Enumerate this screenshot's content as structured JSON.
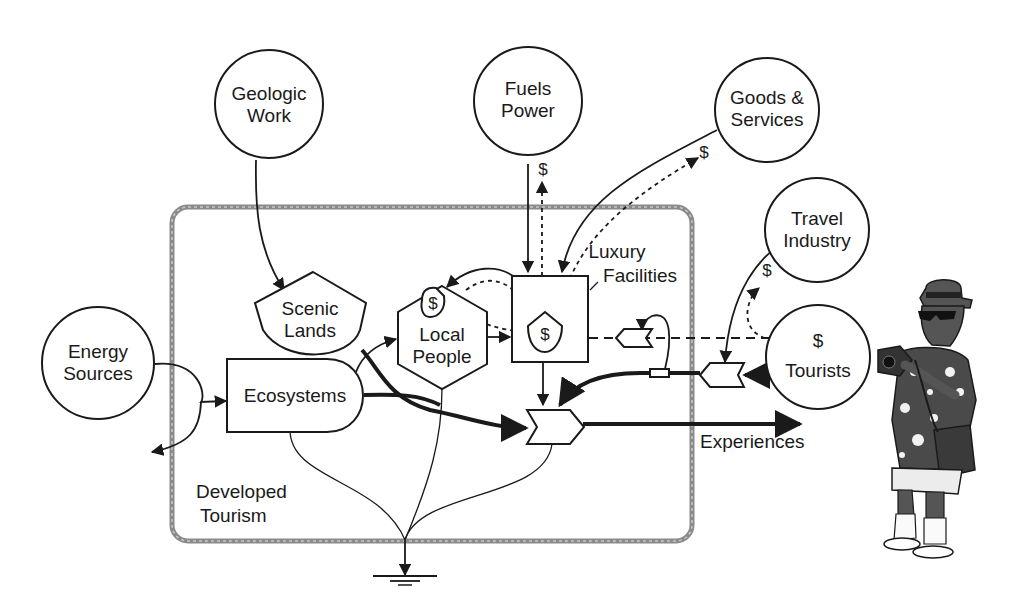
{
  "diagram": {
    "system_boundary_label": [
      "Developed",
      "Tourism"
    ],
    "sources": [
      {
        "id": "energy-sources",
        "label": [
          "Energy",
          "Sources"
        ]
      },
      {
        "id": "geologic-work",
        "label": [
          "Geologic",
          "Work"
        ]
      },
      {
        "id": "fuels-power",
        "label": [
          "Fuels",
          "Power"
        ]
      },
      {
        "id": "goods-services",
        "label": [
          "Goods &",
          "Services"
        ]
      },
      {
        "id": "travel-industry",
        "label": [
          "Travel",
          "Industry"
        ]
      },
      {
        "id": "tourists",
        "label": [
          "Tourists"
        ],
        "money_symbol": "$"
      }
    ],
    "components": [
      {
        "id": "scenic-lands",
        "label": [
          "Scenic",
          "Lands"
        ]
      },
      {
        "id": "ecosystems",
        "label": [
          "Ecosystems"
        ]
      },
      {
        "id": "local-people",
        "label": [
          "Local",
          "People"
        ],
        "money_symbol": "$"
      },
      {
        "id": "luxury-facilities",
        "label": [
          "Luxury",
          "Facilities"
        ],
        "money_symbol": "$"
      }
    ],
    "outputs": {
      "experiences": "Experiences"
    },
    "money_labels": {
      "fuels_power": "$",
      "goods_services": "$",
      "travel_industry": "$",
      "tourists": "$"
    },
    "colors": {
      "line": "#1a1a1a",
      "boundary": "#8a8a8a",
      "background": "#ffffff"
    },
    "illustration": "tourist-with-camera"
  }
}
